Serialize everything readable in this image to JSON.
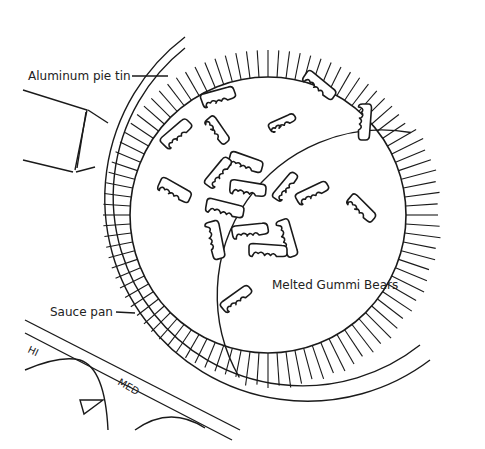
{
  "diagram": {
    "type": "illustration",
    "labels": {
      "pie_tin": "Aluminum pie tin",
      "sauce_pan": "Sauce pan",
      "gummi_bears": "Melted Gummi Bears"
    },
    "stove_knob_labels": [
      "HI",
      "MED"
    ],
    "gummi_bear_count": 20,
    "line_color": "#1a1a1a",
    "background": "#ffffff"
  }
}
